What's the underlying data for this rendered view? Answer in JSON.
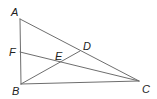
{
  "diagram": {
    "type": "geometry",
    "line_color": "#6e6e6e",
    "label_color": "#222222",
    "points": {
      "A": {
        "x": 20,
        "y": 19,
        "label": "A",
        "lx": 11,
        "ly": 16
      },
      "B": {
        "x": 21,
        "y": 84,
        "label": "B",
        "lx": 12,
        "ly": 95
      },
      "C": {
        "x": 139,
        "y": 81,
        "label": "C",
        "lx": 142,
        "ly": 93
      },
      "D": {
        "x": 80,
        "y": 51,
        "label": "D",
        "lx": 83,
        "ly": 50
      },
      "E": {
        "x": 61,
        "y": 62,
        "label": "E",
        "lx": 55,
        "ly": 60
      },
      "F": {
        "x": 20,
        "y": 52,
        "label": "F",
        "lx": 9,
        "ly": 56
      }
    },
    "segments": [
      {
        "from": "A",
        "to": "B"
      },
      {
        "from": "A",
        "to": "C"
      },
      {
        "from": "B",
        "to": "C"
      },
      {
        "from": "B",
        "to": "D"
      },
      {
        "from": "F",
        "to": "C"
      }
    ]
  }
}
